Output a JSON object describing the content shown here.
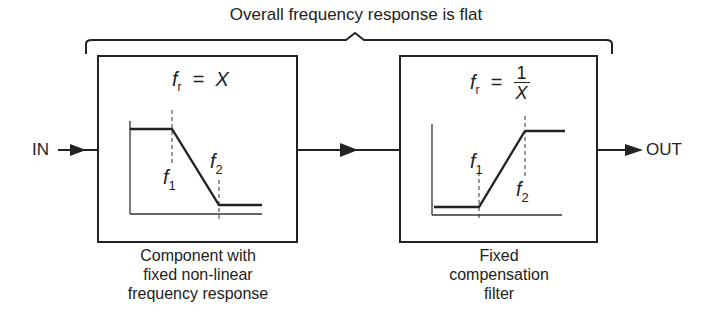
{
  "diagram": {
    "title": "Overall frequency response is flat",
    "input_label": "IN",
    "output_label": "OUT",
    "blocks": [
      {
        "id": "component",
        "formula": {
          "var": "f",
          "sub": "r",
          "eq": "=",
          "value": "X"
        },
        "caption": [
          "Component with",
          "fixed non-linear",
          "frequency response"
        ],
        "curve": "low-pass (high then falling, flat low)",
        "markers": [
          {
            "var": "f",
            "sub": "1"
          },
          {
            "var": "f",
            "sub": "2"
          }
        ]
      },
      {
        "id": "compensation",
        "formula": {
          "var": "f",
          "sub": "r",
          "eq": "=",
          "numerator": "1",
          "denominator": "X"
        },
        "caption": [
          "Fixed",
          "compensation",
          "filter"
        ],
        "curve": "high-boost (low then rising, flat high)",
        "markers": [
          {
            "var": "f",
            "sub": "1"
          },
          {
            "var": "f",
            "sub": "2"
          }
        ]
      }
    ],
    "colors": {
      "stroke": "#222222",
      "background": "#ffffff"
    }
  }
}
